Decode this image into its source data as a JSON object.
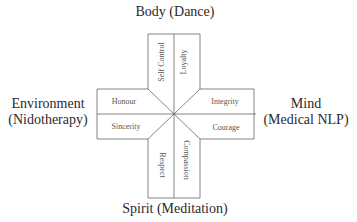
{
  "diagram": {
    "labels": {
      "top": "Body (Dance)",
      "bottom": "Spirit (Meditation)",
      "left_line1": "Environment",
      "left_line2": "(Nidotherapy)",
      "right_line1": "Mind",
      "right_line2": "(Medical NLP)"
    },
    "segments": {
      "top_left": "Self Control",
      "top_right": "Loyalty",
      "right_top": "Integrity",
      "right_bottom": "Courage",
      "bottom_right": "Compassion",
      "bottom_left": "Respect",
      "left_bottom": "Sincerity",
      "left_top": "Honour"
    },
    "colors": {
      "line": "#666666",
      "text": "#333333"
    }
  }
}
